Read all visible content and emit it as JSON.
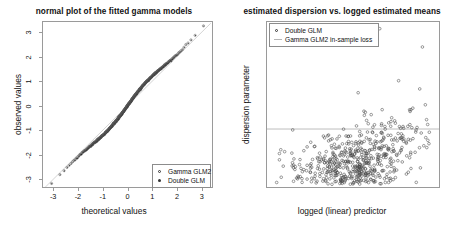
{
  "figure": {
    "width": 456,
    "height": 229,
    "background": "#ffffff",
    "panels": 2
  },
  "chart_data": [
    {
      "type": "scatter",
      "id": "qq-plot",
      "title": "normal plot of the fitted gamma models",
      "xlabel": "theoretical values",
      "ylabel": "observed values",
      "xlim": [
        -3.45,
        3.45
      ],
      "ylim": [
        -3.35,
        3.45
      ],
      "xticks": [
        -3,
        -2,
        -1,
        0,
        1,
        2,
        3
      ],
      "yticks": [
        -3,
        -2,
        -1,
        0,
        1,
        2,
        3
      ],
      "grid": false,
      "legend": {
        "position": "bottom-right",
        "entries": [
          {
            "label": "Gamma GLM2",
            "marker": "open-circle",
            "color": "#333333"
          },
          {
            "label": "Double GLM",
            "marker": "filled-circle",
            "color": "#333333"
          }
        ]
      },
      "reference_line": {
        "type": "qq-line",
        "slope": 1.0,
        "intercept": 0.0,
        "color": "#c8c8c8"
      },
      "series": [
        {
          "name": "Gamma GLM2",
          "marker": "open-circle",
          "color": "#555555",
          "n_points": 520,
          "note": "near-diagonal S-shaped quantile trace, heavy overplot"
        },
        {
          "name": "Double GLM",
          "marker": "filled-circle",
          "color": "#222222",
          "n_points": 520,
          "note": "overlaps Gamma GLM2 almost exactly"
        }
      ]
    },
    {
      "type": "scatter",
      "id": "dispersion-plot",
      "title": "estimated dispersion vs. logged estimated means",
      "xlabel": "logged (linear) predictor",
      "ylabel": "dispersion parameter",
      "xlim": [
        7.6,
        11.75
      ],
      "ylim": [
        0.42,
        4.12
      ],
      "xticks": [
        8,
        9,
        10,
        11
      ],
      "yticks": [
        0.5,
        1.0,
        1.5,
        2.0,
        2.5,
        3.0,
        3.5,
        4.0
      ],
      "grid": false,
      "legend": {
        "position": "top-left",
        "entries": [
          {
            "label": "Double GLM",
            "marker": "open-circle",
            "color": "#333333"
          },
          {
            "label": "Gamma GLM2 in-sample loss",
            "marker": "hline",
            "color": "#b5b5b5"
          }
        ]
      },
      "reference_line": {
        "type": "hline",
        "y": 1.72,
        "color": "#b5b5b5",
        "label": "Gamma GLM2 in-sample loss"
      },
      "series": [
        {
          "name": "Double GLM",
          "marker": "open-circle",
          "color": "#4a4a4a",
          "n_points": 640,
          "note": "cloud rising from ~1.0 at x=8.5 to ~2.6 at x=11.2; spread widens with x"
        }
      ]
    }
  ]
}
